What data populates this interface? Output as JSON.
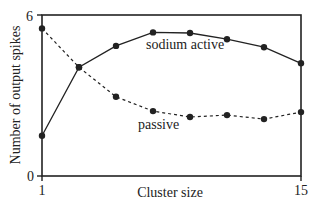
{
  "chart_data": {
    "type": "line",
    "title": "",
    "xlabel": "Cluster size",
    "ylabel": "Number of output spikes",
    "x": [
      1,
      3,
      5,
      7,
      9,
      11,
      13,
      15
    ],
    "xlim": [
      1,
      15
    ],
    "ylim": [
      0,
      6
    ],
    "xticks": [
      1,
      15
    ],
    "yticks": [
      0,
      6
    ],
    "xtick_labels": [
      "1",
      "15"
    ],
    "ytick_labels": [
      "0",
      "6"
    ],
    "grid": false,
    "legend": "inline labels",
    "series": [
      {
        "name": "sodium active",
        "style": "solid",
        "values": [
          1.5,
          4.05,
          4.85,
          5.35,
          5.33,
          5.1,
          4.8,
          4.2
        ]
      },
      {
        "name": "passive",
        "style": "dashed",
        "values": [
          5.5,
          4.05,
          2.95,
          2.42,
          2.2,
          2.27,
          2.12,
          2.38
        ]
      }
    ],
    "annotations": [
      "sodium active",
      "passive"
    ]
  },
  "colors": {
    "line": "#222222",
    "background": "#ffffff"
  }
}
